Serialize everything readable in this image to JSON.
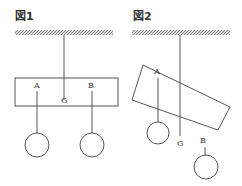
{
  "figures": [
    {
      "title": "図1",
      "labels": {
        "a": "A",
        "g": "G",
        "b": "B"
      },
      "description": "Horizontal bar suspended from ceiling at G, weights hanging from A and B"
    },
    {
      "title": "図2",
      "labels": {
        "a": "A",
        "g": "G",
        "b": "B"
      },
      "description": "Tilted bar suspended from ceiling, weights hanging from A and B"
    }
  ],
  "colors": {
    "line": "#444444",
    "ceiling": "#888888",
    "background": "#ffffff"
  }
}
